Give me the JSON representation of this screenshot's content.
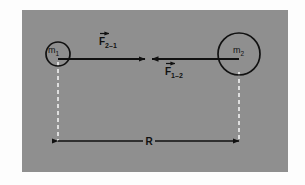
{
  "figure": {
    "name": "newtons-law-of-universal-gravitation-diagram",
    "panel_color": "#8f8f8f",
    "page_background": "#fdfdfd",
    "ink_color": "#111111",
    "dashed_line_color": "#f2f2f2"
  },
  "masses": [
    {
      "id": "m1",
      "label": "m",
      "subscript": "1",
      "center_x": 58,
      "center_y": 54,
      "radius": 12
    },
    {
      "id": "m2",
      "label": "m",
      "subscript": "2",
      "center_x": 239,
      "center_y": 54,
      "radius": 21
    }
  ],
  "forces": [
    {
      "id": "F2-1",
      "symbol": "F",
      "subscript": "2–1",
      "vector_accent": true,
      "direction": "right",
      "label_position": "above",
      "tail_x": 58,
      "tip_x": 145,
      "y": 59
    },
    {
      "id": "F1-2",
      "symbol": "F",
      "subscript": "1–2",
      "vector_accent": true,
      "direction": "left",
      "label_position": "below",
      "tail_x": 239,
      "tip_x": 152,
      "y": 59
    }
  ],
  "separation": {
    "id": "R",
    "label": "R",
    "left_x": 58,
    "right_x": 239,
    "y": 141,
    "arrowheads": "both"
  },
  "guide_lines": [
    {
      "id": "left-guide",
      "x": 58,
      "top_y": 62,
      "bottom_y": 141
    },
    {
      "id": "right-guide",
      "x": 239,
      "top_y": 72,
      "bottom_y": 141
    }
  ]
}
